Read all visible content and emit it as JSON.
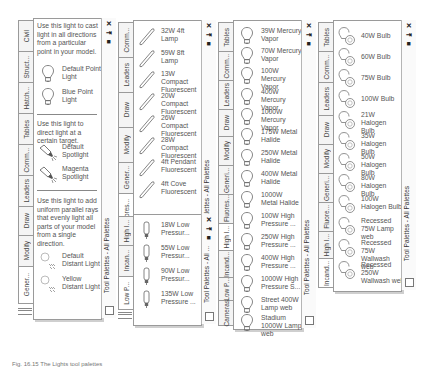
{
  "caption": "Fig. 16.15 The Lights tool palettes",
  "common": {
    "close_glyph": "✕",
    "autohide_glyph": "⇥",
    "properties_glyph": "■",
    "title": "Tool Palettes - All Palettes",
    "title_short": "Tool Palettes - All ..."
  },
  "palette1": {
    "tabs": [
      "Civil",
      "Struct...",
      "Hatch...",
      "Tables",
      "Comm...",
      "Leaders",
      "Draw",
      "Modify",
      "Gener..."
    ],
    "active_tab": "Gener...",
    "sections": [
      {
        "description": "Use this light to cast light in all directions from a particular point in your model.",
        "items": [
          {
            "label": "Default Point Light",
            "icon": "point-light-icon"
          },
          {
            "label": "Blue Point Light",
            "icon": "point-light-icon"
          }
        ]
      },
      {
        "description": "Use this light to direct light at a certain target.",
        "items": [
          {
            "label": "Default Spotlight",
            "icon": "spotlight-icon"
          },
          {
            "label": "Magenta Spotlight",
            "icon": "spotlight-icon"
          }
        ]
      },
      {
        "description": "Use this light to add uniform parallel rays that evenly light all parts of your model from a single direction.",
        "items": [
          {
            "label": "Default Distant Light",
            "icon": "distant-light-icon"
          },
          {
            "label": "Yellow Distant Light",
            "icon": "distant-light-icon"
          }
        ]
      }
    ]
  },
  "palette2": {
    "tabs": [
      "Comm...",
      "Leaders",
      "Draw",
      "Modify",
      "Gener...",
      "Fluores..."
    ],
    "active_tab": "Fluores...",
    "items": [
      "32W 4ft Lamp",
      "59W 8ft Lamp",
      "13W Compact Fluorescent",
      "20W Compact Fluorescent",
      "26W Compact Fluorescent",
      "28W Compact Fluorescent",
      "4ft Pendant Fluorescent",
      "4ft Cove Fluorescent"
    ]
  },
  "palette3": {
    "tabs": [
      "High I...",
      "Incan...",
      "Low P..."
    ],
    "active_tab": "Low P...",
    "items": [
      "18W Low Pressur...",
      "55W Low Pressur...",
      "90W Low Pressur...",
      "135W Low Pressure ..."
    ]
  },
  "palette4": {
    "tabs": [
      "Tables",
      "Comm...",
      "Leaders",
      "Draw",
      "Modify",
      "Generi...",
      "Fluores...",
      "High I...",
      "Incand...",
      "Low P...",
      "Cameras"
    ],
    "active_tab": "High I...",
    "items": [
      "39W Mercury Vapor",
      "70W Mercury Vapor",
      "100W Mercury Vapor",
      "400W Mercury Vapor",
      "1000W Mercury Vapor",
      "175W Metal Halide",
      "250W Metal Halide",
      "400W Metal Halide",
      "1000W Metal Halide",
      "100W High Pressure ...",
      "250W High Pressure ...",
      "400W High Pressure ...",
      "1000W High Pressure S...",
      "Street 400W Lamp web",
      "Stadium 1000W Lamp web"
    ]
  },
  "palette5": {
    "tabs": [
      "Tables",
      "Comm...",
      "Leaders",
      "Draw",
      "Modify",
      "Generi...",
      "Fluore...",
      "High I...",
      "Incand..."
    ],
    "active_tab": "Incand...",
    "items": [
      "40W Bulb",
      "60W Bulb",
      "75W Bulb",
      "100W Bulb",
      "21W Halogen Bulb",
      "35W Halogen Bulb",
      "50W Halogen Bulb",
      "80W Halogen Bulb",
      "100W Halogen Bulb",
      "Recessed 75W Lamp web",
      "Recessed 75W Wallwash web",
      "Recessed 250W Wallwash web"
    ]
  }
}
